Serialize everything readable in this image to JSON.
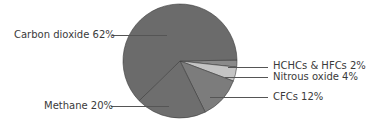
{
  "chart_data": {
    "type": "pie",
    "title": "",
    "slices": [
      {
        "label": "Carbon dioxide",
        "value": 62,
        "color": "#6b6b6b",
        "display": "Carbon dioxide 62%"
      },
      {
        "label": "Methane",
        "value": 20,
        "color": "#6e6e6e",
        "display": "Methane 20%"
      },
      {
        "label": "CFCs",
        "value": 12,
        "color": "#7c7c7c",
        "display": "CFCs 12%"
      },
      {
        "label": "Nitrous oxide",
        "value": 4,
        "color": "#c4c4c4",
        "display": "Nitrous oxide 4%"
      },
      {
        "label": "HCHCs & HFCs",
        "value": 2,
        "color": "#8a8a8a",
        "display": "HCHCs & HFCs 2%"
      }
    ],
    "legend": "leader-line labels"
  },
  "labels": {
    "co2": "Carbon dioxide 62%",
    "methane": "Methane 20%",
    "cfcs": "CFCs 12%",
    "n2o": "Nitrous oxide 4%",
    "hchc": "HCHCs & HFCs 2%"
  }
}
